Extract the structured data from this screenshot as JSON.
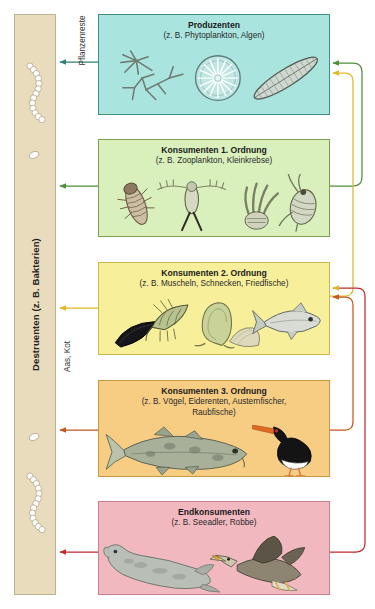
{
  "diagram": {
    "background_color": "#ffffff"
  },
  "destruents": {
    "label": "Destruenten (z. B. Bakterien)",
    "color": "#e8dcbc",
    "border_color": "#bdb296"
  },
  "flow_labels": {
    "plant_remains": "Pflanzenreste",
    "carrion_feces": "Aas, Kot"
  },
  "levels": [
    {
      "id": "produzenten",
      "title": "Produzenten",
      "subtitle": "(z. B. Phytoplankton, Algen)",
      "fill": "#a9e4de",
      "stroke": "#3f8f86",
      "arrow_color": "#2f7f74",
      "organisms": [
        "star-diatom",
        "round-diatom",
        "needle-diatom"
      ]
    },
    {
      "id": "konsumenten-1",
      "title": "Konsumenten 1. Ordnung",
      "subtitle": "(z. B. Zooplankton, Kleinkrebse)",
      "fill": "#d9f0bd",
      "stroke": "#7ca04e",
      "arrow_color": "#4e8f3a",
      "organisms": [
        "isopod",
        "copepod",
        "larva",
        "water-flea"
      ]
    },
    {
      "id": "konsumenten-2",
      "title": "Konsumenten 2. Ordnung",
      "subtitle": "(z. B. Muscheln, Schnecken, Friedfische)",
      "fill": "#f7ef9a",
      "stroke": "#c9b94a",
      "arrow_color": "#e0b828",
      "organisms": [
        "mussel",
        "shrimp",
        "snail",
        "clam",
        "herring"
      ]
    },
    {
      "id": "konsumenten-3",
      "title": "Konsumenten 3. Ordnung",
      "subtitle": "(z. B. Vögel, Eiderenten, Austernfischer,",
      "subtitle2": "Raubfische)",
      "fill": "#f7cd84",
      "stroke": "#c9993f",
      "arrow_color": "#c4561f",
      "organisms": [
        "cod",
        "oystercatcher"
      ]
    },
    {
      "id": "endkonsumenten",
      "title": "Endkonsumenten",
      "subtitle": "(z. B. Seeadler, Robbe)",
      "fill": "#f2b8bf",
      "stroke": "#c9828d",
      "arrow_color": "#c02a32",
      "organisms": [
        "seal",
        "sea-eagle"
      ]
    }
  ]
}
